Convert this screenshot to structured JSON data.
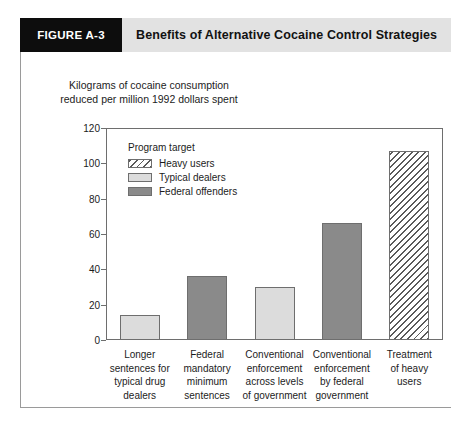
{
  "header": {
    "figure_number": "FIGURE A-3",
    "title": "Benefits of Alternative Cocaine Control Strategies",
    "badge_bg": "#0d0d0d",
    "band_bg": "#e2e2e2"
  },
  "axis_caption": {
    "line1": "Kilograms of cocaine consumption",
    "line2": "reduced per million 1992 dollars spent"
  },
  "legend": {
    "title": "Program target",
    "items": [
      {
        "label": "Heavy users",
        "style": "hatched",
        "color": "#ffffff"
      },
      {
        "label": "Typical dealers",
        "style": "solid",
        "color": "#dcdcdc"
      },
      {
        "label": "Federal offenders",
        "style": "solid",
        "color": "#8a8a8a"
      }
    ]
  },
  "chart_data": {
    "type": "bar",
    "title": "Benefits of Alternative Cocaine Control Strategies",
    "subtitle": "",
    "xlabel": "",
    "ylabel": "Kilograms of cocaine consumption reduced per million 1992 dollars spent",
    "ylim": [
      0,
      120
    ],
    "yticks": [
      0,
      20,
      40,
      60,
      80,
      100,
      120
    ],
    "ytick_labels": [
      "0",
      "20",
      "40",
      "60",
      "80",
      "100",
      "120"
    ],
    "grid": false,
    "legend_position": "inside-upper-left",
    "categories": [
      "Longer sentences for typical drug dealers",
      "Federal mandatory minimum sentences",
      "Conventional enforcement across levels of government",
      "Conventional enforcement by federal government",
      "Treatment of heavy users"
    ],
    "category_lines": [
      [
        "Longer",
        "sentences for",
        "typical drug",
        "dealers"
      ],
      [
        "Federal",
        "mandatory",
        "minimum",
        "sentences"
      ],
      [
        "Conventional",
        "enforcement",
        "across levels",
        "of government"
      ],
      [
        "Conventional",
        "enforcement",
        "by federal",
        "government"
      ],
      [
        "Treatment",
        "of heavy",
        "users"
      ]
    ],
    "values": [
      14,
      36,
      30,
      66,
      107
    ],
    "bar_groups": [
      "Typical dealers",
      "Federal offenders",
      "Typical dealers",
      "Federal offenders",
      "Heavy users"
    ],
    "bar_styles": [
      "solid-light",
      "solid-dark",
      "solid-light",
      "solid-dark",
      "hatched"
    ],
    "series": [
      {
        "name": "Kilograms of cocaine consumption reduced per million 1992 dollars spent",
        "values": [
          14,
          36,
          30,
          66,
          107
        ]
      }
    ]
  }
}
